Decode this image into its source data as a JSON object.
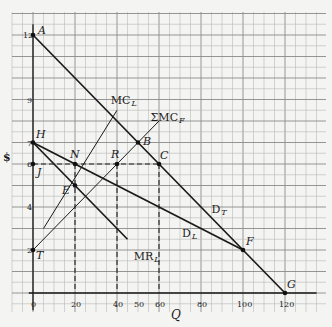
{
  "diagram": {
    "type": "economics-cartel-pricing",
    "axes": {
      "x_label": "Q",
      "y_label": "$",
      "x_ticks": [
        "0",
        "20",
        "40",
        "50",
        "60",
        "80",
        "100",
        "120"
      ],
      "y_ticks": [
        "12",
        "9",
        "7",
        "6",
        "4",
        "2"
      ]
    },
    "points": {
      "A": {
        "label": "A",
        "q": 0,
        "p": 12
      },
      "B": {
        "label": "B",
        "q": 50,
        "p": 7
      },
      "C": {
        "label": "C",
        "q": 60,
        "p": 6
      },
      "E": {
        "label": "E",
        "q": 20,
        "p": 5
      },
      "F": {
        "label": "F",
        "q": 100,
        "p": 2
      },
      "G": {
        "label": "G",
        "q": 120,
        "p": 0
      },
      "H": {
        "label": "H",
        "q": 0,
        "p": 7
      },
      "J": {
        "label": "J",
        "q": 0,
        "p": 6
      },
      "N": {
        "label": "N",
        "q": 20,
        "p": 6
      },
      "R": {
        "label": "R",
        "q": 40,
        "p": 6
      },
      "T": {
        "label": "T",
        "q": 0,
        "p": 2
      }
    },
    "curves": {
      "DT": {
        "label": "D",
        "sub": "T",
        "from": [
          0,
          12
        ],
        "to": [
          120,
          0
        ]
      },
      "DL": {
        "label": "D",
        "sub": "L",
        "from": [
          0,
          7
        ],
        "to": [
          100,
          2
        ]
      },
      "MRL": {
        "label": "MR",
        "sub": "L",
        "from": [
          0,
          7
        ],
        "to": [
          45,
          2.5
        ]
      },
      "MCL": {
        "label": "MC",
        "sub": "L",
        "from": [
          5,
          3
        ],
        "to": [
          40,
          8.5
        ]
      },
      "SMCF": {
        "label": "ΣMC",
        "sub": "F",
        "from": [
          0,
          2
        ],
        "to": [
          60,
          8
        ]
      }
    },
    "dashed": {
      "price_line": {
        "from": [
          0,
          6
        ],
        "to": [
          60,
          6
        ]
      },
      "drop_N": {
        "q": 20,
        "from_p": 6,
        "to_p": 0
      },
      "drop_R": {
        "q": 40,
        "from_p": 6,
        "to_p": 0
      },
      "drop_C": {
        "q": 60,
        "from_p": 6,
        "to_p": 0
      }
    }
  }
}
